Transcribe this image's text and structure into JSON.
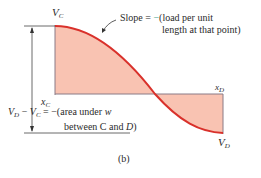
{
  "figure": {
    "caption": "(b)",
    "labels": {
      "vc_main": "V",
      "vc_sub": "C",
      "vd_main": "V",
      "vd_sub": "D",
      "xc_main": "x",
      "xc_sub": "C",
      "xd_main": "x",
      "xd_sub": "D"
    },
    "slope_annotation": {
      "prefix": "Slope = ",
      "minus": "−",
      "line1": "(load per unit",
      "line2": "length at that point)"
    },
    "area_annotation": {
      "vd": "V",
      "vd_sub": "D",
      "op": " − ",
      "vc": "V",
      "vc_sub": "C",
      "rest1": " = −(area under ",
      "w": "w",
      "line2a": "between C and ",
      "line2b": "D",
      "line2c": ")"
    },
    "colors": {
      "curve": "#d9312b",
      "fill": "#f9c3b2",
      "axis": "#8a7a86",
      "minus_accent": "#3aa08a"
    }
  }
}
